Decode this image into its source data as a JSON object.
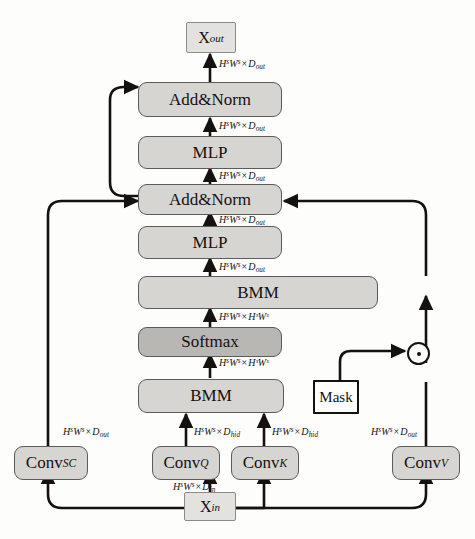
{
  "figure": {
    "background_color": "#fdfdfb",
    "block_fill": "#d7d5d2",
    "block_fill_dark": "#b9b7b4",
    "terminal_fill": "#e4e2df",
    "mask_fill": "#ffffff",
    "line_color": "#14110f"
  },
  "nodes": {
    "x_out": {
      "label": "X",
      "sub": "out",
      "type": "terminal"
    },
    "x_in": {
      "label": "X",
      "sub": "in",
      "type": "terminal"
    },
    "addnorm_top": {
      "label": "Add&Norm",
      "type": "block"
    },
    "mlp_top": {
      "label": "MLP",
      "type": "block"
    },
    "addnorm_mid": {
      "label": "Add&Norm",
      "type": "block"
    },
    "mlp_mid": {
      "label": "MLP",
      "type": "block"
    },
    "bmm_upper": {
      "label": "BMM",
      "type": "block"
    },
    "softmax": {
      "label": "Softmax",
      "type": "block-dark"
    },
    "bmm_lower": {
      "label": "BMM",
      "type": "block"
    },
    "mask": {
      "label": "Mask",
      "type": "mask-box"
    },
    "conv_sc": {
      "label": "Conv",
      "sub": "SC",
      "type": "block"
    },
    "conv_q": {
      "label": "Conv",
      "sub": "Q",
      "type": "block"
    },
    "conv_k": {
      "label": "Conv",
      "sub": "K",
      "type": "block"
    },
    "conv_v": {
      "label": "Conv",
      "sub": "V",
      "type": "block"
    },
    "elementwise_mul": {
      "label": "circled-dot",
      "symbol": "⊙",
      "type": "operator"
    }
  },
  "dimension_labels": {
    "out_top": {
      "text": "HˢWˢ × D_out",
      "base1": "H",
      "sup1": "s",
      "base2": "W",
      "sup2": "s",
      "dim": "D",
      "dimsub": "out"
    },
    "addnorm_top_in": {
      "text": "HˢWˢ × D_out",
      "base1": "H",
      "sup1": "s",
      "base2": "W",
      "sup2": "s",
      "dim": "D",
      "dimsub": "out"
    },
    "mlp_top_in": {
      "text": "HˢWˢ × D_out",
      "base1": "H",
      "sup1": "s",
      "base2": "W",
      "sup2": "s",
      "dim": "D",
      "dimsub": "out"
    },
    "addnorm_mid_in": {
      "text": "HˢWˢ × D_out",
      "base1": "H",
      "sup1": "s",
      "base2": "W",
      "sup2": "s",
      "dim": "D",
      "dimsub": "out"
    },
    "mlp_mid_in": {
      "text": "HˢWˢ × D_out",
      "base1": "H",
      "sup1": "s",
      "base2": "W",
      "sup2": "s",
      "dim": "D",
      "dimsub": "out"
    },
    "bmm_upper_in": {
      "text": "HˢWˢ × HˢWˢ",
      "base1": "H",
      "sup1": "s",
      "base2": "W",
      "sup2": "s",
      "dim": "HˢWˢ",
      "dimsub": ""
    },
    "softmax_in": {
      "text": "HˢWˢ × HˢWˢ",
      "base1": "H",
      "sup1": "s",
      "base2": "W",
      "sup2": "s",
      "dim": "HˢWˢ",
      "dimsub": ""
    },
    "conv_sc_out": {
      "text": "HˢWˢ × D_out",
      "base1": "H",
      "sup1": "s",
      "base2": "W",
      "sup2": "s",
      "dim": "D",
      "dimsub": "out"
    },
    "conv_q_out": {
      "text": "HˢWˢ × D_hid",
      "base1": "H",
      "sup1": "s",
      "base2": "W",
      "sup2": "s",
      "dim": "D",
      "dimsub": "hid"
    },
    "conv_k_out": {
      "text": "HˢWˢ × D_hid",
      "base1": "H",
      "sup1": "s",
      "base2": "W",
      "sup2": "s",
      "dim": "D",
      "dimsub": "hid"
    },
    "conv_v_out": {
      "text": "HˢWˢ × D_out",
      "base1": "H",
      "sup1": "s",
      "base2": "W",
      "sup2": "s",
      "dim": "D",
      "dimsub": "out"
    },
    "x_in_out": {
      "text": "HˢWˢ × D_in",
      "base1": "H",
      "sup1": "s",
      "base2": "W",
      "sup2": "s",
      "dim": "D",
      "dimsub": "in"
    }
  },
  "symbols": {
    "times": "×",
    "sup_s": "s"
  }
}
